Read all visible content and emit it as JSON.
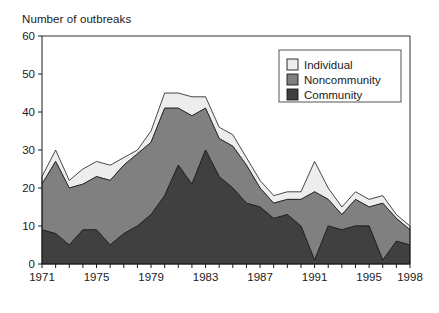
{
  "chart_data": {
    "type": "area",
    "stacked": true,
    "title": "Number of outbreaks",
    "ylabel": "Number of outbreaks",
    "xlabel": "",
    "ylim": [
      0,
      60
    ],
    "ytick_values": [
      0,
      10,
      20,
      30,
      40,
      50,
      60
    ],
    "ytick_labels": [
      "0",
      "10",
      "20",
      "30",
      "40",
      "50",
      "60"
    ],
    "xlim": [
      1971,
      1998
    ],
    "xtick_labels": [
      "1971",
      "1975",
      "1979",
      "1983",
      "1987",
      "1991",
      "1995",
      "1998"
    ],
    "xtick_values": [
      1971,
      1975,
      1979,
      1983,
      1987,
      1991,
      1995,
      1998
    ],
    "grid": false,
    "legend_position": "top-right",
    "x": [
      1971,
      1972,
      1973,
      1974,
      1975,
      1976,
      1977,
      1978,
      1979,
      1980,
      1981,
      1982,
      1983,
      1984,
      1985,
      1986,
      1987,
      1988,
      1989,
      1990,
      1991,
      1992,
      1993,
      1994,
      1995,
      1996,
      1997,
      1998
    ],
    "series": [
      {
        "name": "Community",
        "color": "#404040",
        "values": [
          9,
          8,
          5,
          9,
          9,
          5,
          8,
          10,
          13,
          18,
          26,
          21,
          30,
          23,
          20,
          16,
          15,
          12,
          13,
          10,
          1,
          10,
          9,
          10,
          10,
          1,
          6,
          5
        ]
      },
      {
        "name": "Noncommunity",
        "color": "#808080",
        "values": [
          12,
          19,
          15,
          12,
          14,
          17,
          18,
          19,
          19,
          23,
          15,
          18,
          11,
          10,
          11,
          10,
          5,
          4,
          4,
          7,
          18,
          7,
          4,
          7,
          5,
          15,
          6,
          4
        ]
      },
      {
        "name": "Individual",
        "color": "#ededed",
        "values": [
          2,
          3,
          2,
          4,
          4,
          4,
          2,
          1,
          3,
          4,
          4,
          5,
          3,
          3,
          3,
          2,
          2,
          2,
          2,
          2,
          8,
          3,
          2,
          2,
          2,
          2,
          1,
          1
        ]
      }
    ],
    "legend_entries": [
      {
        "label": "Individual",
        "color": "#ededed"
      },
      {
        "label": "Noncommunity",
        "color": "#808080"
      },
      {
        "label": "Community",
        "color": "#404040"
      }
    ]
  },
  "axis_title": "Number of outbreaks"
}
